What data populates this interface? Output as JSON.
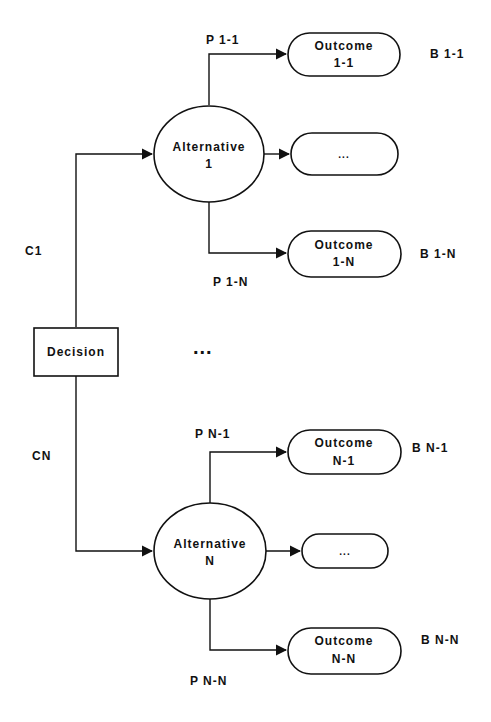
{
  "decision": {
    "label": "Decision"
  },
  "branches": [
    {
      "cost_label": "C1",
      "alternative": {
        "line1": "Alternative",
        "line2": "1"
      },
      "outcomes": [
        {
          "line1": "Outcome",
          "line2": "1-1",
          "prob": "P 1-1",
          "benefit": "B 1-1"
        },
        {
          "line1": "...",
          "line2": "",
          "prob": "",
          "benefit": ""
        },
        {
          "line1": "Outcome",
          "line2": "1-N",
          "prob": "P 1-N",
          "benefit": "B 1-N"
        }
      ]
    },
    {
      "cost_label": "CN",
      "alternative": {
        "line1": "Alternative",
        "line2": "N"
      },
      "outcomes": [
        {
          "line1": "Outcome",
          "line2": "N-1",
          "prob": "P N-1",
          "benefit": "B N-1"
        },
        {
          "line1": "...",
          "line2": "",
          "prob": "",
          "benefit": ""
        },
        {
          "line1": "Outcome",
          "line2": "N-N",
          "prob": "P N-N",
          "benefit": "B N-N"
        }
      ]
    }
  ],
  "middle_ellipsis": "..."
}
